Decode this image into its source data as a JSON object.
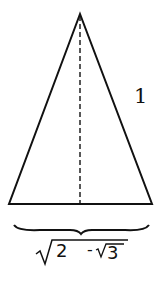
{
  "diagram": {
    "type": "isosceles-triangle",
    "side_label": "1",
    "base_label": {
      "outer_radicand": "2",
      "minus": "-",
      "inner_radicand": "3",
      "text": "√(2 − √3)"
    },
    "colors": {
      "stroke": "#111111",
      "background": "#ffffff"
    }
  }
}
